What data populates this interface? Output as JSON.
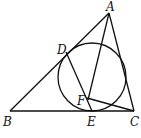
{
  "diagram": {
    "type": "geometry",
    "points": {
      "A": {
        "label": "A",
        "x": 109,
        "y": 13
      },
      "B": {
        "label": "B",
        "x": 10,
        "y": 111
      },
      "C": {
        "label": "C",
        "x": 134,
        "y": 111
      },
      "D": {
        "label": "D",
        "x": 66,
        "y": 52
      },
      "E": {
        "label": "E",
        "x": 92,
        "y": 111
      },
      "F": {
        "label": "F",
        "x": 87,
        "y": 98
      }
    },
    "circle": {
      "cx": 92,
      "cy": 77,
      "r": 34
    },
    "segments": [
      [
        "A",
        "B"
      ],
      [
        "B",
        "C"
      ],
      [
        "C",
        "A"
      ],
      [
        "A",
        "E"
      ],
      [
        "D",
        "E"
      ],
      [
        "F",
        "C"
      ]
    ]
  }
}
